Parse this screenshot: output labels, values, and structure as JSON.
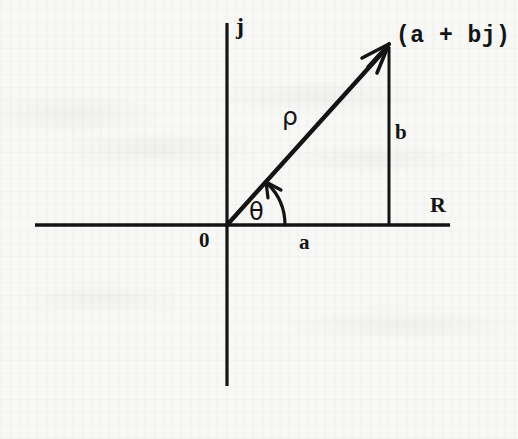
{
  "figure": {
    "background_color": "#f8f8f6",
    "ink_color": "#141414"
  },
  "axes": {
    "real": {
      "label": "R",
      "name": "real-axis",
      "x1": 35,
      "y1": 225,
      "x2": 450,
      "y2": 225,
      "label_x": 430,
      "label_y": 194,
      "label_size": 22
    },
    "imaginary": {
      "label": "j",
      "name": "imaginary-axis",
      "x1": 227,
      "y1": 23,
      "x2": 227,
      "y2": 386,
      "label_x": 236,
      "label_y": 14,
      "label_size": 24
    },
    "origin": {
      "label": "0",
      "x": 227,
      "y": 225,
      "label_x": 199,
      "label_y": 230,
      "label_size": 21
    }
  },
  "vector": {
    "name": "complex-number-vector",
    "point_label": "(a + bj)",
    "point_label_x": 396,
    "point_label_y": 25,
    "point_label_size": 23,
    "tail_x": 227,
    "tail_y": 225,
    "head_x": 389,
    "head_y": 45,
    "magnitude_label": "ρ",
    "magnitude_label_x": 282,
    "magnitude_label_y": 104,
    "magnitude_label_size": 25,
    "angle_label": "θ",
    "angle_label_x": 249,
    "angle_label_y": 200,
    "angle_label_size": 24
  },
  "components": {
    "real_part": {
      "label": "a",
      "label_x": 299,
      "label_y": 232,
      "label_size": 21
    },
    "imaginary_part": {
      "label": "b",
      "label_x": 395,
      "label_y": 122,
      "label_size": 21,
      "line_x": 389,
      "line_y1": 45,
      "line_y2": 225
    }
  },
  "angle_arc": {
    "name": "theta-arc",
    "center_x": 227,
    "center_y": 225,
    "radius": 58,
    "start_deg": 0,
    "end_deg": 48
  }
}
